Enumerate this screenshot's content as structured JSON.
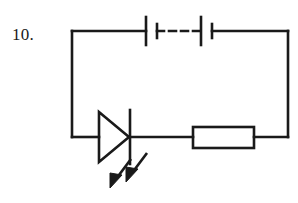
{
  "figure": {
    "kind": "circuit-diagram",
    "question_number": "10.",
    "background_color": "#ffffff",
    "stroke_color": "#1a1a1a",
    "canvas": {
      "width": 298,
      "height": 203
    }
  },
  "circuit": {
    "loop": {
      "label": "circuit-loop",
      "left": 72,
      "top": 31,
      "right": 288,
      "bottom": 137,
      "stroke_width": 2.6
    },
    "components": [
      {
        "id": "battery",
        "name": "battery-symbol",
        "type": "multi-cell-battery",
        "branch": "top",
        "center_y": 31,
        "cells": [
          {
            "long_plate_x": 146,
            "short_plate_x": 157
          },
          {
            "long_plate_x": 201,
            "short_plate_x": 212
          }
        ],
        "long_plate_half_height": 14,
        "short_plate_half_height": 7,
        "dash_from_x": 157,
        "dash_to_x": 201,
        "dash_pattern": "7,5",
        "stroke_width": 2.6
      },
      {
        "id": "led",
        "name": "led-symbol",
        "type": "light-emitting-diode",
        "branch": "bottom",
        "center_y": 137,
        "triangle": {
          "x_left": 98,
          "x_tip": 129,
          "half_height": 25
        },
        "cathode_bar": {
          "x": 130,
          "half_height": 27
        },
        "stroke_width": 2.6,
        "emission_arrows": [
          {
            "x1": 130,
            "y1": 158,
            "x2": 112,
            "y2": 182
          },
          {
            "x1": 146,
            "y1": 152,
            "x2": 128,
            "y2": 176
          }
        ],
        "arrow_head_length": 12,
        "arrow_head_width": 9
      },
      {
        "id": "resistor",
        "name": "resistor-symbol",
        "type": "rectangular-resistor",
        "branch": "bottom",
        "center_y": 137,
        "box": {
          "x": 193,
          "y": 127,
          "width": 61,
          "height": 21
        },
        "stroke_width": 2.6
      }
    ]
  }
}
